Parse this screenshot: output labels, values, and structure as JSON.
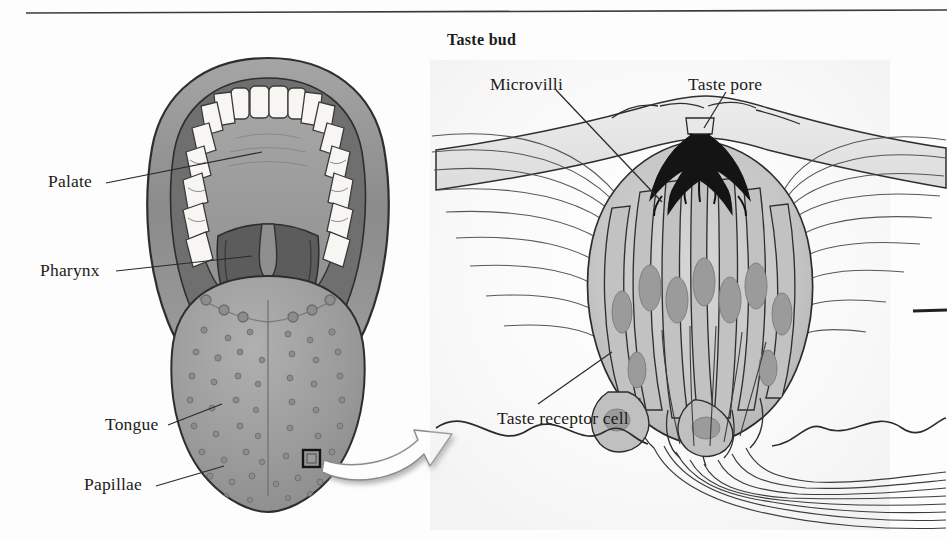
{
  "figure": {
    "title_right": "Taste bud",
    "top_rule": "horizontal-rule",
    "background_color": "#fdfdfd",
    "ink_color": "#1b1b1b"
  },
  "panels": {
    "left": {
      "name": "oral-cavity-illustration",
      "labels": [
        {
          "text": "Palate",
          "x": 48,
          "y": 173
        },
        {
          "text": "Pharynx",
          "x": 40,
          "y": 262
        },
        {
          "text": "Tongue",
          "x": 105,
          "y": 419
        },
        {
          "text": "Papillae",
          "x": 84,
          "y": 478
        }
      ],
      "parts": {
        "lips": "#8f8f8f",
        "teeth": "#f6f5f2",
        "palate": "#9a9a9a",
        "pharynx": "#6e6e6e",
        "tongue": "#9d9d9d",
        "uvula": "#8a8a8a"
      },
      "callout_box": {
        "x": 303,
        "y": 450,
        "size": 17
      }
    },
    "right": {
      "name": "taste-bud-illustration",
      "labels": [
        {
          "text": "Microvilli",
          "x": 490,
          "y": 78
        },
        {
          "text": "Taste pore",
          "x": 688,
          "y": 78
        },
        {
          "text": "Taste receptor\ncell",
          "x": 497,
          "y": 414
        }
      ],
      "parts": {
        "epithelium": "#d8d8d8",
        "bud_body": "#c9c9c9",
        "receptor_cell": "#bdbdbd",
        "nucleus": "#9b9b9b",
        "microvilli": "#1d1d1d",
        "nerve_fibers": "#5c5c5c"
      }
    }
  },
  "connector": {
    "name": "magnification-arrow",
    "style": "curved-3d-white-arrow",
    "from": "tongue-callout-box",
    "to": "taste-bud-panel"
  },
  "right_edge_mark": {
    "name": "edge-leader-dash",
    "x": 915,
    "y": 311
  }
}
